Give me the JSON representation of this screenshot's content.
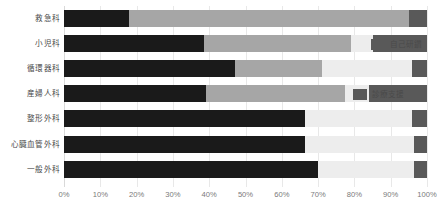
{
  "chart_data": {
    "type": "bar",
    "orientation": "horizontal",
    "stacked": true,
    "normalized_percent": true,
    "title": "",
    "subtitle": "",
    "xlabel": "",
    "ylabel": "",
    "xlim": [
      0,
      100
    ],
    "grid": true,
    "legend_position": "inline-overlay",
    "categories": [
      "救急科",
      "小児科",
      "循環器科",
      "産婦人科",
      "整形外科",
      "心臓血管外科",
      "一般外科"
    ],
    "xticks": [
      "0%",
      "10%",
      "20%",
      "30%",
      "40%",
      "50%",
      "60%",
      "70%",
      "80%",
      "90%",
      "100%"
    ],
    "xtick_values": [
      0,
      10,
      20,
      30,
      40,
      50,
      60,
      70,
      80,
      90,
      100
    ],
    "series": [
      {
        "name": "series-1",
        "color": "#1a1a1a",
        "values": [
          18.0,
          38.5,
          47.0,
          39.0,
          66.5,
          66.5,
          70.0
        ]
      },
      {
        "name": "series-2",
        "color": "#a6a6a6",
        "values": [
          77.0,
          40.5,
          24.0,
          38.5,
          0.0,
          0.0,
          0.0
        ]
      },
      {
        "name": "自己研鑽",
        "color": "#ededed",
        "values": [
          0.0,
          6.0,
          25.0,
          6.5,
          29.5,
          30.0,
          26.5
        ]
      },
      {
        "name": "診療支援",
        "color": "#595959",
        "values": [
          5.0,
          15.0,
          4.0,
          16.0,
          4.0,
          3.5,
          3.5
        ]
      }
    ],
    "legend_entries": [
      {
        "label": "自己研鑽",
        "color": "#595959",
        "row_index": 1
      },
      {
        "label": "診療支援",
        "color": "#595959",
        "row_index": 3
      }
    ]
  },
  "colors": {
    "series_1": "#1a1a1a",
    "series_2": "#a6a6a6",
    "series_3": "#ededed",
    "series_4": "#595959",
    "gridline": "#e8e8e8",
    "axis_text": "#7a7a7a",
    "label_text": "#4a4a4a",
    "background": "#ffffff"
  }
}
